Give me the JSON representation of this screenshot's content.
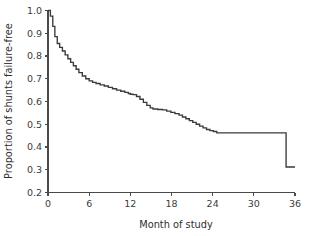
{
  "chart_data": {
    "type": "line",
    "title": "",
    "subtitle": "",
    "xlabel": "Month of study",
    "ylabel": "Proportion of shunts failure-free",
    "xlim": [
      0,
      36
    ],
    "ylim": [
      0.2,
      1.0
    ],
    "xticks": [
      0,
      6,
      12,
      18,
      24,
      30,
      36
    ],
    "xtick_labels": [
      "0",
      "6",
      "12",
      "18",
      "24",
      "30",
      "36"
    ],
    "yticks": [
      0.2,
      0.3,
      0.4,
      0.5,
      0.6,
      0.7,
      0.8,
      0.9,
      1.0
    ],
    "ytick_labels": [
      "0.2",
      "0.3",
      "0.4",
      "0.5",
      "0.6",
      "0.7",
      "0.8",
      "0.9",
      "1.0"
    ],
    "grid": false,
    "legend": null,
    "annotations": [],
    "line_color": "#3a3a3a",
    "axis_color": "#4a4a4a",
    "series": [
      {
        "name": "Shunt failure-free survival",
        "step": "post",
        "x": [
          0,
          0.35,
          0.7,
          1.0,
          1.35,
          1.7,
          2.1,
          2.5,
          2.9,
          3.3,
          3.7,
          4.1,
          4.5,
          5.0,
          5.5,
          6.0,
          6.5,
          7.0,
          7.6,
          8.2,
          8.8,
          9.4,
          10.0,
          10.6,
          11.2,
          11.7,
          12.0,
          12.4,
          12.9,
          13.4,
          13.9,
          14.4,
          14.9,
          15.3,
          16.0,
          16.7,
          17.3,
          17.9,
          18.5,
          19.1,
          19.6,
          20.1,
          20.6,
          21.1,
          21.6,
          22.1,
          22.6,
          23.1,
          23.6,
          24.1,
          24.6,
          34.7,
          34.7,
          36.0
        ],
        "y": [
          1.0,
          0.975,
          0.93,
          0.885,
          0.855,
          0.838,
          0.822,
          0.805,
          0.788,
          0.772,
          0.757,
          0.742,
          0.727,
          0.712,
          0.7,
          0.691,
          0.684,
          0.679,
          0.673,
          0.668,
          0.662,
          0.656,
          0.65,
          0.645,
          0.64,
          0.635,
          0.632,
          0.63,
          0.622,
          0.61,
          0.596,
          0.583,
          0.572,
          0.567,
          0.565,
          0.563,
          0.558,
          0.552,
          0.547,
          0.54,
          0.532,
          0.524,
          0.516,
          0.508,
          0.5,
          0.492,
          0.484,
          0.477,
          0.472,
          0.468,
          0.462,
          0.462,
          0.312,
          0.312
        ]
      }
    ]
  }
}
